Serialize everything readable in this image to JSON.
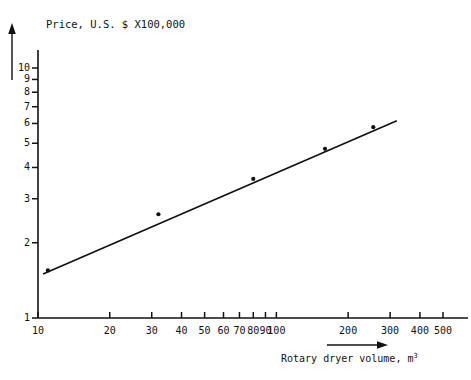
{
  "figure": {
    "title": "Price, U.S. $ X100,000",
    "x_axis_label_text": "Rotary dryer volume, m",
    "x_axis_label_exponent": "3",
    "background_color": "#ffffff",
    "ink_color": "#111111"
  },
  "chart_data": {
    "type": "scatter",
    "title": "Price, U.S. $ X100,000",
    "subtitle": "",
    "xlabel": "Rotary dryer volume, m3",
    "ylabel": "Price, U.S. $ X100,000",
    "xscale": "log",
    "yscale": "log",
    "xlim": [
      10,
      530
    ],
    "ylim": [
      1,
      11
    ],
    "grid": false,
    "legend": null,
    "x_ticks": [
      10,
      20,
      30,
      40,
      50,
      60,
      70,
      80,
      90,
      100,
      200,
      300,
      400,
      500
    ],
    "x_tick_labels": [
      "10",
      "20",
      "30",
      "40",
      "50",
      "60",
      "70",
      "80",
      "90",
      "100",
      "200",
      "300",
      "400",
      "500"
    ],
    "y_ticks": [
      1,
      2,
      3,
      4,
      5,
      6,
      7,
      8,
      9,
      10
    ],
    "y_tick_labels": [
      "1",
      "2",
      "3",
      "4",
      "5",
      "6",
      "7",
      "8",
      "9",
      "10"
    ],
    "series": [
      {
        "name": "data points",
        "type": "scatter",
        "marker": "dot",
        "x": [
          11,
          32,
          80,
          160,
          255
        ],
        "y": [
          1.55,
          2.6,
          3.6,
          4.75,
          5.8
        ]
      },
      {
        "name": "fitted line",
        "type": "line",
        "x": [
          10.5,
          320
        ],
        "y": [
          1.5,
          6.15
        ]
      }
    ],
    "annotations": [
      {
        "name": "y-axis-arrow",
        "direction": "up"
      },
      {
        "name": "x-axis-arrow",
        "direction": "right"
      }
    ]
  }
}
